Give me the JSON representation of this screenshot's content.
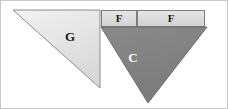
{
  "figure": {
    "background_color": "#ffffff",
    "frame_color": "#c8c8c8",
    "width": 228,
    "height": 109
  },
  "regions": [
    {
      "id": "g",
      "label": "G",
      "shape": "triangle",
      "fill": "#e2e2e2",
      "stroke": "#8a8a8a",
      "points": "13,10 100,10 100,88",
      "label_x": 70,
      "label_y": 38,
      "label_class": "dark-text"
    },
    {
      "id": "f-left",
      "label": "F",
      "shape": "rectangle",
      "fill": "#dcdcdc",
      "stroke": "#7d7d7d",
      "x": 101,
      "y": 10,
      "w": 36,
      "h": 17,
      "label_x": 119,
      "label_y": 19,
      "label_class": "dark-text"
    },
    {
      "id": "f-right",
      "label": "F",
      "shape": "rectangle",
      "fill": "#dcdcdc",
      "stroke": "#7d7d7d",
      "x": 137,
      "y": 10,
      "w": 68,
      "h": 17,
      "label_x": 171,
      "label_y": 19,
      "label_class": "dark-text"
    },
    {
      "id": "c",
      "label": "C",
      "shape": "triangle",
      "fill": "#818181",
      "stroke": "#6a6a6a",
      "points": "101,27 207,27 148,103",
      "label_x": 133,
      "label_y": 59,
      "label_class": "light-text"
    }
  ]
}
